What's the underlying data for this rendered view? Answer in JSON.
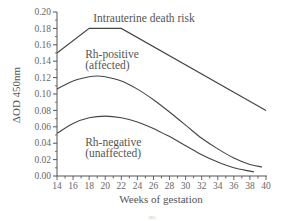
{
  "chart_data": {
    "type": "line",
    "title": "",
    "xlabel": "Weeks of gestation",
    "ylabel": "ΔOD 450nm",
    "xlim": [
      14,
      40
    ],
    "ylim": [
      0.0,
      0.2
    ],
    "grid": false,
    "legend": "none (curves labeled directly)",
    "x_ticks": [
      14,
      16,
      18,
      20,
      22,
      24,
      26,
      28,
      30,
      32,
      34,
      36,
      38,
      40
    ],
    "y_ticks": [
      "0.00",
      "0.02",
      "0.04",
      "0.06",
      "0.08",
      "0.10",
      "0.12",
      "0.14",
      "0.16",
      "0.18",
      "0.20"
    ],
    "series": [
      {
        "name": "Intrauterine death risk",
        "x": [
          14,
          18,
          22,
          40
        ],
        "values": [
          0.15,
          0.18,
          0.18,
          0.08
        ]
      },
      {
        "name": "Rh-positive (affected)",
        "x": [
          14,
          16,
          18,
          19,
          20,
          22,
          24,
          26,
          28,
          30,
          32,
          34,
          36,
          38,
          39.5
        ],
        "values": [
          0.106,
          0.116,
          0.121,
          0.122,
          0.121,
          0.116,
          0.106,
          0.093,
          0.078,
          0.062,
          0.046,
          0.033,
          0.022,
          0.014,
          0.011
        ]
      },
      {
        "name": "Rh-negative (unaffected)",
        "x": [
          14,
          16,
          18,
          20,
          22,
          24,
          26,
          28,
          30,
          32,
          34,
          36,
          38,
          38.5
        ],
        "values": [
          0.052,
          0.064,
          0.071,
          0.073,
          0.071,
          0.066,
          0.058,
          0.048,
          0.037,
          0.026,
          0.017,
          0.01,
          0.006,
          0.005
        ]
      }
    ],
    "annotations": [
      {
        "text": "Intrauterine death risk",
        "x": 18.5,
        "y": 0.188
      },
      {
        "text": "Rh-positive",
        "x": 17.5,
        "y": 0.144
      },
      {
        "text": "(affected)",
        "x": 17.5,
        "y": 0.131
      },
      {
        "text": "Rh-negative",
        "x": 17.5,
        "y": 0.036
      },
      {
        "text": "(unaffected)",
        "x": 17.5,
        "y": 0.023
      }
    ],
    "panel_label": "(B)"
  }
}
